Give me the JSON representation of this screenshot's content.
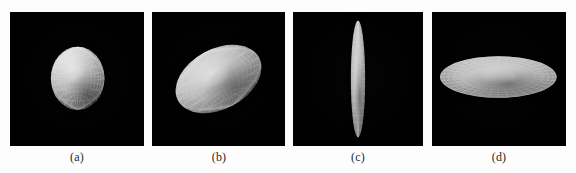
{
  "figure": {
    "background_color": "#fdfdfd",
    "panel_background_color": "#010101",
    "mesh_color": "#f2f2f2",
    "surface_color": "#d8d8d8",
    "panel_count": 4,
    "panels": [
      {
        "id": "a",
        "caption": "(a)",
        "shape": "sphere",
        "shape_label": "near-spherical ellipsoid, front view",
        "rotation_deg": 0,
        "radius_x_frac": 0.2,
        "radius_y_frac": 0.235,
        "center_x_frac": 0.505,
        "center_y_frac": 0.495,
        "meridians": 18,
        "parallels": 12,
        "highlight_x_frac": 0.4,
        "highlight_y_frac": 0.33
      },
      {
        "id": "b",
        "caption": "(b)",
        "shape": "oblate-ellipsoid-tilted",
        "shape_label": "oblate ellipsoid, tilted oblique view",
        "rotation_deg": -28,
        "radius_x_frac": 0.345,
        "radius_y_frac": 0.225,
        "center_x_frac": 0.5,
        "center_y_frac": 0.5,
        "meridians": 22,
        "parallels": 12,
        "highlight_x_frac": 0.46,
        "highlight_y_frac": 0.36
      },
      {
        "id": "c",
        "caption": "(c)",
        "shape": "flat-disc-edge-on",
        "shape_label": "flattened disc seen edge-on, thin vertical spindle",
        "rotation_deg": 0,
        "radius_x_frac": 0.055,
        "radius_y_frac": 0.435,
        "center_x_frac": 0.5,
        "center_y_frac": 0.5,
        "meridians": 6,
        "parallels": 16,
        "highlight_x_frac": 0.46,
        "highlight_y_frac": 0.42
      },
      {
        "id": "d",
        "caption": "(d)",
        "shape": "flat-disc-face-on",
        "shape_label": "flattened disc seen near face-on, wide shallow ellipse",
        "rotation_deg": 0,
        "radius_x_frac": 0.435,
        "radius_y_frac": 0.155,
        "center_x_frac": 0.495,
        "center_y_frac": 0.485,
        "meridians": 36,
        "parallels": 9,
        "highlight_x_frac": 0.5,
        "highlight_y_frac": 0.42
      }
    ]
  }
}
